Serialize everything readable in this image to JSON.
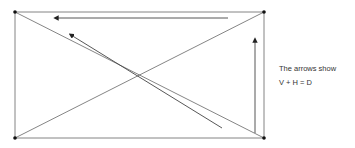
{
  "diagram": {
    "type": "rectangle-with-diagonals-and-vector-arrows",
    "colors": {
      "line": "#555555",
      "arrow": "#444444",
      "vertex": "#111111",
      "text": "#333333"
    },
    "caption": {
      "line1": "The arrows show",
      "line2": "V + H = D"
    },
    "arrows": [
      {
        "name": "H",
        "direction": "left",
        "description": "horizontal arrow along top edge"
      },
      {
        "name": "V",
        "direction": "up",
        "description": "vertical arrow along right edge"
      },
      {
        "name": "D",
        "direction": "up-left",
        "description": "diagonal arrow parallel to main diagonal"
      }
    ]
  }
}
